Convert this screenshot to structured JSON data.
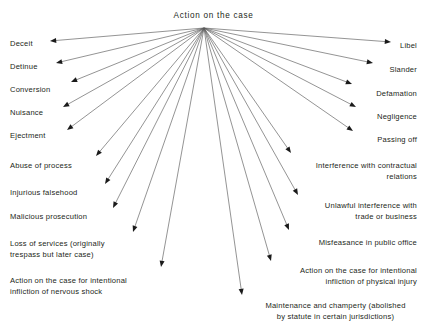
{
  "diagram": {
    "type": "radial-fan-tree",
    "title": "Action on the case",
    "background_color": "#ffffff",
    "text_color": "#231f20",
    "line_color": "#5a5a5a",
    "arrowhead_color": "#1a1a1a",
    "hub": {
      "x": 204,
      "y": 28
    },
    "nodes": [
      {
        "id": "deceit",
        "label": "Deceit",
        "side": "left",
        "text_x": 10,
        "text_y": 38,
        "text_w": 36,
        "tip_x": 50,
        "tip_y": 41
      },
      {
        "id": "detinue",
        "label": "Detinue",
        "side": "left",
        "text_x": 10,
        "text_y": 61,
        "text_w": 41,
        "tip_x": 56,
        "tip_y": 63
      },
      {
        "id": "conversion",
        "label": "Conversion",
        "side": "left",
        "text_x": 10,
        "text_y": 84,
        "text_w": 55,
        "tip_x": 71,
        "tip_y": 82
      },
      {
        "id": "nuisance",
        "label": "Nuisance",
        "side": "left",
        "text_x": 10,
        "text_y": 107,
        "text_w": 48,
        "tip_x": 63,
        "tip_y": 107
      },
      {
        "id": "ejectment",
        "label": "Ejectment",
        "side": "left",
        "text_x": 10,
        "text_y": 130,
        "text_w": 50,
        "tip_x": 67,
        "tip_y": 130
      },
      {
        "id": "abuse-of-process",
        "label": "Abuse of process",
        "side": "left",
        "text_x": 10,
        "text_y": 160,
        "text_w": 83,
        "tip_x": 96,
        "tip_y": 156
      },
      {
        "id": "injurious-falsehood",
        "label": "Injurious falsehood",
        "side": "left",
        "text_x": 10,
        "text_y": 187,
        "text_w": 88,
        "tip_x": 105,
        "tip_y": 184
      },
      {
        "id": "malicious-prosecution",
        "label": "Malicious prosecution",
        "side": "left",
        "text_x": 10,
        "text_y": 211,
        "text_w": 100,
        "tip_x": 113,
        "tip_y": 208
      },
      {
        "id": "loss-of-services",
        "label": "Loss of services (originally\ntrespass but later case)",
        "side": "left",
        "text_x": 10,
        "text_y": 238,
        "text_w": 130,
        "tip_x": 133,
        "tip_y": 232
      },
      {
        "id": "nervous-shock",
        "label": "Action on the case for intentional\ninfliction of nervous shock",
        "side": "left",
        "text_x": 10,
        "text_y": 275,
        "text_w": 160,
        "tip_x": 161,
        "tip_y": 267
      },
      {
        "id": "maintenance-champerty",
        "label": "Maintenance and champerty (abolished\nby statute in certain jurisdictions)",
        "side": "center",
        "text_x": 248,
        "text_y": 300,
        "text_w": 175,
        "tip_x": 242,
        "tip_y": 295
      },
      {
        "id": "physical-injury",
        "label": "Action on the case for intentional\ninfliction of physical injury",
        "side": "right",
        "text_x": 257,
        "text_y": 265,
        "text_w": 160,
        "tip_x": 271,
        "tip_y": 261
      },
      {
        "id": "misfeasance",
        "label": "Misfeasance in public office",
        "side": "right",
        "text_x": 287,
        "text_y": 237,
        "text_w": 130,
        "tip_x": 289,
        "tip_y": 230
      },
      {
        "id": "unlawful-interference",
        "label": "Unlawful interference with\ntrade or business",
        "side": "right",
        "text_x": 287,
        "text_y": 200,
        "text_w": 130,
        "tip_x": 298,
        "tip_y": 195
      },
      {
        "id": "interference-contractual",
        "label": "Interference with contractual\nrelations",
        "side": "right",
        "text_x": 287,
        "text_y": 160,
        "text_w": 130,
        "tip_x": 291,
        "tip_y": 153
      },
      {
        "id": "passing-off",
        "label": "Passing off",
        "side": "right",
        "text_x": 362,
        "text_y": 134,
        "text_w": 55,
        "tip_x": 353,
        "tip_y": 131
      },
      {
        "id": "negligence",
        "label": "Negligence",
        "side": "right",
        "text_x": 361,
        "text_y": 111,
        "text_w": 56,
        "tip_x": 356,
        "tip_y": 107
      },
      {
        "id": "defamation",
        "label": "Defamation",
        "side": "right",
        "text_x": 358,
        "text_y": 88,
        "text_w": 59,
        "tip_x": 352,
        "tip_y": 84
      },
      {
        "id": "slander",
        "label": "Slander",
        "side": "right",
        "text_x": 378,
        "text_y": 64,
        "text_w": 39,
        "tip_x": 373,
        "tip_y": 63
      },
      {
        "id": "libel",
        "label": "Libel",
        "side": "right",
        "text_x": 392,
        "text_y": 40,
        "text_w": 25,
        "tip_x": 391,
        "tip_y": 42
      }
    ]
  }
}
